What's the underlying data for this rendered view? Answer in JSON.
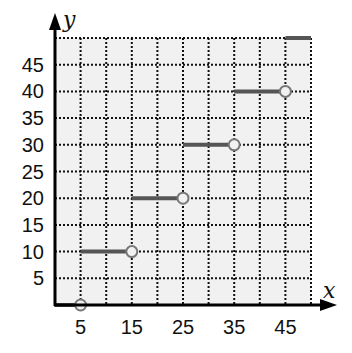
{
  "chart_data": {
    "type": "line",
    "subtype": "step-function",
    "title": "",
    "xlabel": "x",
    "ylabel": "y",
    "xlim": [
      0,
      50
    ],
    "ylim": [
      0,
      50
    ],
    "grid": true,
    "grid_style": "dotted",
    "x_grid_step": 5,
    "y_grid_step": 5,
    "x_ticks": [
      5,
      15,
      25,
      35,
      45
    ],
    "y_ticks": [
      5,
      10,
      15,
      20,
      25,
      30,
      35,
      40,
      45
    ],
    "segments": [
      {
        "x_start": 0,
        "x_end": 5,
        "y": 0,
        "start_closed": true,
        "end_open": true
      },
      {
        "x_start": 5,
        "x_end": 15,
        "y": 10,
        "start_closed": true,
        "end_open": true
      },
      {
        "x_start": 15,
        "x_end": 25,
        "y": 20,
        "start_closed": true,
        "end_open": true
      },
      {
        "x_start": 25,
        "x_end": 35,
        "y": 30,
        "start_closed": true,
        "end_open": true
      },
      {
        "x_start": 35,
        "x_end": 45,
        "y": 40,
        "start_closed": true,
        "end_open": true
      },
      {
        "x_start": 45,
        "x_end": 50,
        "y": 50,
        "start_closed": true,
        "end_open": false
      }
    ],
    "colors": {
      "segment": "#555555",
      "open_circle": "#777777",
      "grid": "#111111",
      "plot_bg": "#f1f1f1",
      "axis": "#000000"
    }
  }
}
